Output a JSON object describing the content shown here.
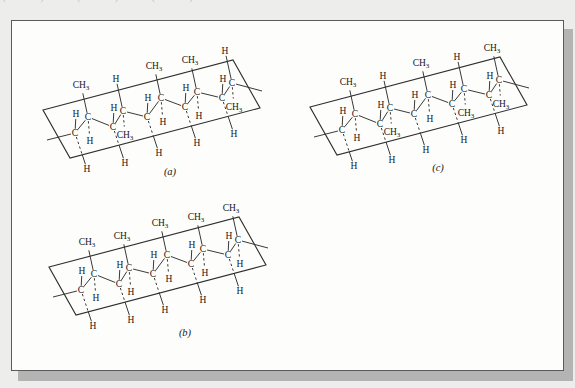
{
  "palette": {
    "background": "#edeeec",
    "paper": "#fdfdfb",
    "border": "#5a5a5a",
    "shadow": "#b4b4b4",
    "ink": "#2e2e2e",
    "text": "#161616",
    "faint": "#c0c0be"
  },
  "top_fragment_text": "( ) ( ) ( )",
  "figure": {
    "backbone_atom": "C",
    "diagrams": [
      {
        "id": "a",
        "caption": "(a)",
        "pendant_top_outside": [
          "CH3",
          "H",
          "CH3",
          "CH3",
          "H"
        ],
        "pendant_bottom_inside": [
          "H",
          "CH3",
          "H",
          "H",
          "CH3"
        ],
        "pendant_top_inside": [
          "H",
          "H",
          "H",
          "H",
          "H"
        ],
        "pendant_bottom_outside": [
          "H",
          "H",
          "H",
          "H",
          "H"
        ]
      },
      {
        "id": "b",
        "caption": "(b)",
        "pendant_top_outside": [
          "CH3",
          "CH3",
          "CH3",
          "CH3",
          "CH3"
        ],
        "pendant_bottom_inside": [
          "H",
          "H",
          "H",
          "H",
          "H"
        ],
        "pendant_top_inside": [
          "H",
          "H",
          "H",
          "H",
          "H"
        ],
        "pendant_bottom_outside": [
          "H",
          "H",
          "H",
          "H",
          "H"
        ]
      },
      {
        "id": "c",
        "caption": "(c)",
        "pendant_top_outside": [
          "CH3",
          "H",
          "CH3",
          "H",
          "CH3"
        ],
        "pendant_bottom_inside": [
          "H",
          "CH3",
          "H",
          "CH3",
          "CH3"
        ],
        "pendant_top_inside": [
          "H",
          "H",
          "H",
          "H",
          "H"
        ],
        "pendant_bottom_outside": [
          "H",
          "H",
          "H",
          "H",
          "H"
        ]
      }
    ]
  }
}
